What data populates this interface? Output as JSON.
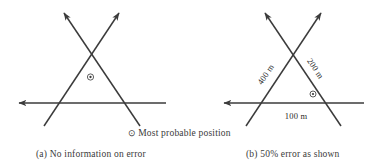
{
  "figure": {
    "background_color": "#ffffff",
    "line_color": "#3b3b3b",
    "panels": [
      {
        "id": "a",
        "caption_label": "(a)",
        "caption_text": "No information on error",
        "marker_symbol": "⊙",
        "dimension_labels": []
      },
      {
        "id": "b",
        "caption_label": "(b)",
        "caption_text_before": "50",
        "caption_percent": "%",
        "caption_text_after": "error as shown",
        "marker_symbol": "⊙",
        "dimension_labels": [
          {
            "name": "left-bearing-distance",
            "text": "400 m"
          },
          {
            "name": "right-bearing-distance",
            "text": "200 m"
          },
          {
            "name": "baseline-distance",
            "text": "100 m"
          }
        ]
      }
    ]
  },
  "legend": {
    "symbol": "⊙",
    "text": "Most probable position"
  },
  "captions": {
    "a_full": "(a)  No information on error",
    "b_full": "(b)  50% error as shown"
  },
  "dimensions": {
    "left_bearing": "400 m",
    "right_bearing": "200 m",
    "baseline": "100 m"
  }
}
